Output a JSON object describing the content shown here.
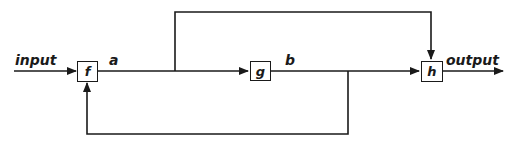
{
  "diagram": {
    "type": "block-diagram",
    "stroke_color": "#1a1a1a",
    "background": "#ffffff",
    "blocks": [
      {
        "id": "f",
        "label": "f"
      },
      {
        "id": "g",
        "label": "g"
      },
      {
        "id": "h",
        "label": "h"
      }
    ],
    "signals": {
      "input": "input",
      "a": "a",
      "b": "b",
      "output": "output"
    },
    "edges": [
      {
        "from": "input",
        "to": "f"
      },
      {
        "from": "f",
        "to": "g",
        "label": "a"
      },
      {
        "from": "f",
        "to": "h",
        "label": "a",
        "route": "top-bypass"
      },
      {
        "from": "g",
        "to": "h",
        "label": "b"
      },
      {
        "from": "g",
        "to": "f",
        "label": "b",
        "route": "bottom-feedback"
      },
      {
        "from": "h",
        "to": "output"
      }
    ]
  }
}
